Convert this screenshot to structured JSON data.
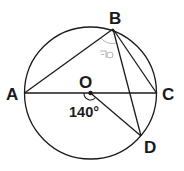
{
  "diagram": {
    "type": "circle-geometry",
    "circle": {
      "center_label": "O",
      "center": [
        90,
        93
      ],
      "radius": 66
    },
    "points": {
      "A": {
        "label": "A",
        "pos": [
          25,
          93
        ]
      },
      "B": {
        "label": "B",
        "pos": [
          113,
          29
        ]
      },
      "C": {
        "label": "C",
        "pos": [
          156,
          93
        ]
      },
      "D": {
        "label": "D",
        "pos": [
          141,
          136
        ]
      },
      "O": {
        "label": "O",
        "pos": [
          90,
          93
        ]
      }
    },
    "segments": [
      "AB",
      "AC",
      "BC",
      "BD",
      "OD"
    ],
    "angles": {
      "AOD": {
        "label": "140°",
        "vertex": "O"
      },
      "ABD": {
        "label": "ㄱ",
        "vertex": "B",
        "note": "unknown angle marker"
      }
    },
    "colors": {
      "stroke": "#1a1a1a",
      "faint": "#b5b5b5",
      "background": "#ffffff"
    }
  }
}
